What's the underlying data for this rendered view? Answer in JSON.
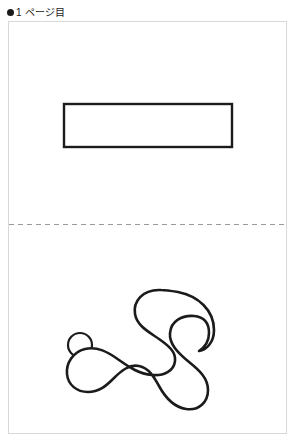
{
  "header": {
    "bullet_icon": "filled-circle-bullet",
    "label": "1 ページ目"
  },
  "page": {
    "background_color": "#ffffff",
    "border_color": "#d8d8d8",
    "width": 279,
    "height": 413
  },
  "divider": {
    "name": "fold-line",
    "style": "dashed",
    "color": "#9a9a9a",
    "dash_length": 5,
    "gap_length": 4,
    "y": 202
  },
  "shapes": {
    "stroke_color": "#1b1b1b",
    "fill_color": "#ffffff",
    "top_half": [
      {
        "name": "rectangle-outline",
        "type": "rect",
        "x": 55,
        "y": 82,
        "width": 168,
        "height": 43,
        "stroke_width": 2.4
      }
    ],
    "bottom_half": [
      {
        "name": "small-circle-outline",
        "type": "circle",
        "cx": 71,
        "cy": 323,
        "r": 12,
        "stroke_width": 2.2
      },
      {
        "name": "blob-outline",
        "type": "path",
        "stroke_width": 2.6,
        "d": "M 152 268 C 133 267 124 280 126 292 C 128 304 140 310 150 317 C 160 324 167 330 166 339 C 165 349 155 354 143 353 C 130 352 120 345 110 338 C 99 330 88 324 76 327 C 64 330 57 341 58 352 C 59 363 68 370 79 370 C 90 370 97 364 104 357 C 112 349 120 342 130 344 C 140 346 145 355 150 364 C 156 375 164 385 177 387 C 190 389 199 380 199 368 C 199 356 190 348 180 340 C 169 331 160 322 161 311 C 162 299 173 293 185 294 C 196 295 200 302 200 311 C 200 319 196 325 190 329 C 197 328 205 321 205 308 C 205 288 189 274 169 270 C 163 269 157 268 152 268 Z"
      }
    ]
  }
}
